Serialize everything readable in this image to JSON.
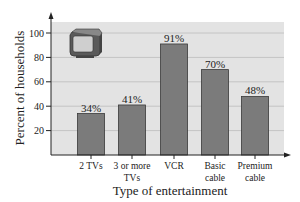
{
  "chart_data": {
    "type": "bar",
    "title": "",
    "xlabel": "Type of entertainment",
    "ylabel": "Percent of households",
    "categories": [
      "2 TVs",
      "3 or more TVs",
      "VCR",
      "Basic cable",
      "Premium cable"
    ],
    "category_lines": [
      [
        "2 TVs"
      ],
      [
        "3 or more",
        "TVs"
      ],
      [
        "VCR"
      ],
      [
        "Basic",
        "cable"
      ],
      [
        "Premium",
        "cable"
      ]
    ],
    "values": [
      34,
      41,
      91,
      70,
      48
    ],
    "data_labels": [
      "34%",
      "41%",
      "91%",
      "70%",
      "48%"
    ],
    "yticks": [
      20,
      40,
      60,
      80,
      100
    ],
    "ylim": [
      0,
      110
    ],
    "grid": true,
    "legend": null,
    "decoration": "television-icon",
    "colors": {
      "bar": "#7b7b7b",
      "bar_edge": "#3a3a3a",
      "plot_bg": "#e3e3e3",
      "grid": "#c4c4c4"
    }
  }
}
